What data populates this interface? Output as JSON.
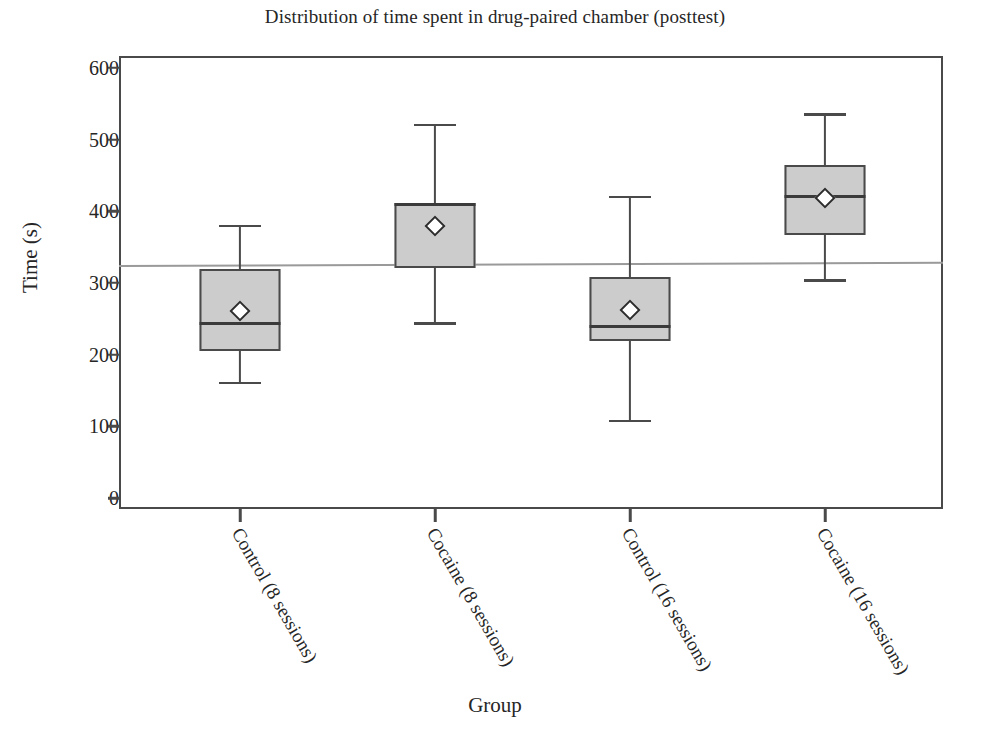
{
  "chart_data": {
    "type": "box",
    "title": "Distribution of time spent in drug-paired chamber (posttest)",
    "xlabel": "Group",
    "ylabel": "Time (s)",
    "ylim": [
      0,
      625
    ],
    "yticks": [
      0,
      100,
      200,
      300,
      400,
      500,
      600
    ],
    "ytick_labels": [
      "0",
      "100",
      "200",
      "300",
      "400",
      "500",
      "600"
    ],
    "grid": false,
    "legend": "none",
    "reference_line": {
      "label": "chance level",
      "value": 325,
      "color": "#9a9a9a"
    },
    "box_fill_color": "#cccccc",
    "box_edge_color": "#4a4a4a",
    "categories": [
      "Control (8 sessions)",
      "Cocaine (8 sessions)",
      "Control (16 sessions)",
      "Cocaine (16 sessions)"
    ],
    "boxes": [
      {
        "label": "Control (8 sessions)",
        "whisker_low": 162,
        "q1": 205,
        "median": 244,
        "q3": 319,
        "whisker_high": 381,
        "mean": 261
      },
      {
        "label": "Cocaine (8 sessions)",
        "whisker_low": 245,
        "q1": 321,
        "median": 410,
        "q3": 412,
        "whisker_high": 522,
        "mean": 379
      },
      {
        "label": "Control (16 sessions)",
        "whisker_low": 109,
        "q1": 219,
        "median": 239,
        "q3": 308,
        "whisker_high": 422,
        "mean": 262
      },
      {
        "label": "Cocaine (16 sessions)",
        "whisker_low": 305,
        "q1": 367,
        "median": 420,
        "q3": 465,
        "whisker_high": 537,
        "mean": 418
      }
    ]
  }
}
